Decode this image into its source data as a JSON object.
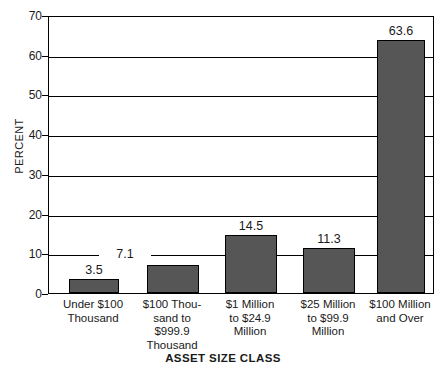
{
  "chart_data": {
    "type": "bar",
    "title": "",
    "xlabel": "ASSET SIZE CLASS",
    "ylabel": "PERCENT",
    "ylim": [
      0,
      70
    ],
    "ytick_step": 10,
    "grid": true,
    "legend": "none",
    "bar_color": "#565656",
    "bar_border_color": "#000000",
    "categories": [
      "Under $100\nThousand",
      "$100 Thou-\nsand to\n$999.9\nThousand",
      "$1 Million\nto $24.9\nMillion",
      "$25 Million\nto $99.9\nMillion",
      "$100 Million\nand Over"
    ],
    "values": [
      3.5,
      7.1,
      14.5,
      11.3,
      63.6
    ],
    "value_labels": [
      "3.5",
      "7.1",
      "14.5",
      "11.3",
      "63.6"
    ],
    "ytick_labels": [
      "70",
      "60",
      "50",
      "40",
      "30",
      "20",
      "10",
      "0"
    ],
    "ytick_values": [
      70,
      60,
      50,
      40,
      30,
      20,
      10,
      0
    ]
  }
}
